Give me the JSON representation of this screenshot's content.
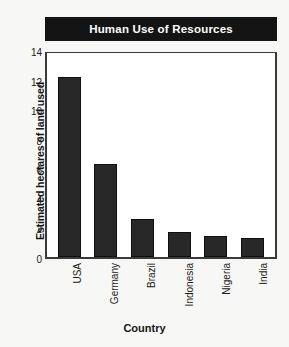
{
  "chart_data": {
    "type": "bar",
    "title": "Human Use of Resources",
    "xlabel": "Country",
    "ylabel": "Estimated hectares of land used",
    "categories": [
      "USA",
      "Germany",
      "Brazil",
      "Indonesia",
      "Nigeria",
      "India"
    ],
    "values": [
      12.2,
      6.3,
      2.6,
      1.7,
      1.4,
      1.3
    ],
    "ylim": [
      0,
      14
    ],
    "ytick_labels": [
      "0",
      "2",
      "4",
      "6",
      "8",
      "10",
      "12",
      "14"
    ],
    "ytick_values": [
      0,
      2,
      4,
      6,
      8,
      10,
      12,
      14
    ],
    "grid": false,
    "legend": "none",
    "bar_color": "#282828",
    "title_background": "#141414",
    "title_color": "#ffffff",
    "axis_color": "#3a3a3a",
    "plot_background": "#ffffff",
    "page_background": "#f7f7f5"
  }
}
